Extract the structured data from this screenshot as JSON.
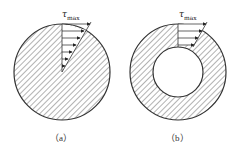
{
  "figures": [
    {
      "id": "a",
      "label": "（a）",
      "shape": "solid-circle",
      "stress_label": "τ",
      "stress_sub": "max",
      "center": [
        62,
        72
      ],
      "outer_radius": 48,
      "inner_radius": 0,
      "arrow_count": 7
    },
    {
      "id": "b",
      "label": "（b）",
      "shape": "hollow-circle",
      "stress_label": "τ",
      "stress_sub": "max",
      "center": [
        178,
        72
      ],
      "outer_radius": 48,
      "inner_radius": 25,
      "arrow_count": 4
    }
  ],
  "colors": {
    "stroke": "#333333",
    "hatch": "#555555",
    "background": "#ffffff"
  }
}
